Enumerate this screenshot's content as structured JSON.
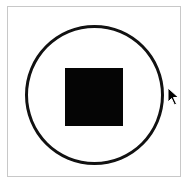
{
  "control": {
    "type": "stop-button",
    "icon": "stop-icon",
    "colors": {
      "stroke": "#111111",
      "fill": "#050505",
      "frame_border": "#c8c8c8",
      "background": "#ffffff"
    }
  },
  "cursor": {
    "icon": "arrow-pointer-icon",
    "x": 167,
    "y": 87
  }
}
